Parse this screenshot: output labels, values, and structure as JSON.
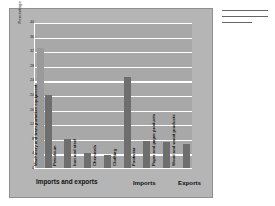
{
  "figure": {
    "background_color": "#b5b5b5",
    "plot_background_color": "#a8a8a8",
    "gridline_color": "#ffffff"
  },
  "side_note": {
    "line_count": 3
  },
  "legend": {
    "imports_label": "Imports",
    "exports_label": "Exports",
    "imports_color": "#9a9a9a",
    "exports_color": "#6e6e6e"
  },
  "chart_data": {
    "type": "bar",
    "title": "",
    "xlabel": "Imports and exports",
    "ylabel": "Percentage of total",
    "ylim": [
      0,
      40
    ],
    "yticks": [
      0,
      4,
      8,
      12,
      16,
      20,
      24,
      28,
      32,
      36,
      40
    ],
    "grid": true,
    "legend_position": "bottom-right",
    "categories": [
      "Machinery and transportation equipment",
      "Petroleum",
      "Iron and steel",
      "Chemicals",
      "Clothing",
      "Footwear",
      "Paper and paper products",
      "Wood and wood products"
    ],
    "series": [
      {
        "name": "Imports",
        "color": "#9a9a9a",
        "values": [
          33,
          0,
          0,
          0,
          0,
          0,
          0,
          0
        ]
      },
      {
        "name": "Exports",
        "color": "#6e6e6e",
        "values": [
          20,
          8,
          4,
          3.5,
          25,
          7.5,
          7,
          6.5
        ]
      }
    ]
  }
}
